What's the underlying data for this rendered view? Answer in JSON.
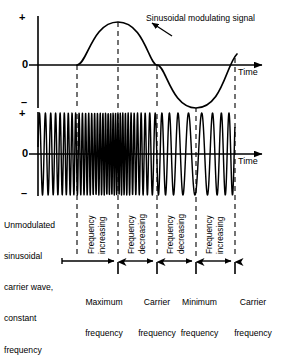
{
  "figure": {
    "kind": "frequency-modulation-waveform-diagram",
    "background_color": "#ffffff",
    "ink_color": "#000000"
  },
  "top_plot": {
    "axis_plus": "+",
    "axis_zero": "0",
    "axis_minus": "–",
    "time_label": "Time",
    "annotation": "Sinusoidal modulating signal"
  },
  "bottom_plot": {
    "axis_plus": "+",
    "axis_zero": "0",
    "axis_minus": "–",
    "time_label": "Time"
  },
  "left_caption": {
    "lines": [
      "Unmodulated",
      "sinusoidal",
      "carrier wave,",
      "constant",
      "frequency"
    ]
  },
  "region_labels": [
    {
      "line1": "Frequency",
      "line2": "increasing"
    },
    {
      "line1": "Frequency",
      "line2": "decreasing"
    },
    {
      "line1": "Frequency",
      "line2": "decreasing"
    },
    {
      "line1": "Frequency",
      "line2": "increasing"
    }
  ],
  "marker_labels": [
    {
      "line1": "Maximum",
      "line2": "frequency"
    },
    {
      "line1": "Carrier",
      "line2": "frequency"
    },
    {
      "line1": "Minimum",
      "line2": "frequency"
    },
    {
      "line1": "Carrier",
      "line2": "frequency"
    }
  ],
  "chart_data": {
    "type": "line",
    "xlabel": "Time",
    "ylabel": "",
    "grid": false,
    "legend_position": "none",
    "guide_lines_x": [
      77,
      118,
      157,
      196,
      235
    ],
    "series": [
      {
        "name": "Sinusoidal modulating signal",
        "plot": "top",
        "description": "One full cycle of a sine wave: zero crossing rising at x=77, positive peak at x=118, zero crossing falling at x=157, negative trough at x=196, zero crossing rising at x=235",
        "x_axis_range": [
          38,
          235
        ],
        "y_axis_labels": [
          "+",
          "0",
          "–"
        ],
        "key_points": [
          {
            "x": 77,
            "y": 0,
            "note": "zero crossing rising"
          },
          {
            "x": 118,
            "y": 1,
            "note": "positive peak"
          },
          {
            "x": 157,
            "y": 0,
            "note": "zero crossing falling"
          },
          {
            "x": 196,
            "y": -1,
            "note": "negative trough"
          },
          {
            "x": 235,
            "y": 0,
            "note": "zero crossing rising"
          }
        ]
      },
      {
        "name": "Frequency modulated carrier wave",
        "plot": "bottom",
        "description": "Constant-amplitude carrier whose instantaneous frequency follows the modulating sine: highest density at x=118, lowest density at x=196",
        "x_axis_range": [
          38,
          235
        ],
        "y_axis_labels": [
          "+",
          "0",
          "–"
        ],
        "amplitude_constant": true,
        "instantaneous_frequency_points": [
          {
            "x": 38,
            "relative_frequency": 1.0,
            "note": "carrier frequency"
          },
          {
            "x": 77,
            "relative_frequency": 1.9,
            "note": "frequency increasing"
          },
          {
            "x": 118,
            "relative_frequency": 2.8,
            "note": "maximum frequency"
          },
          {
            "x": 157,
            "relative_frequency": 1.0,
            "note": "carrier frequency"
          },
          {
            "x": 196,
            "relative_frequency": 0.45,
            "note": "minimum frequency"
          },
          {
            "x": 235,
            "relative_frequency": 1.0,
            "note": "carrier frequency"
          }
        ]
      }
    ],
    "regions": [
      {
        "from_x": 77,
        "to_x": 118,
        "label": "Frequency increasing"
      },
      {
        "from_x": 118,
        "to_x": 157,
        "label": "Frequency decreasing"
      },
      {
        "from_x": 157,
        "to_x": 196,
        "label": "Frequency decreasing"
      },
      {
        "from_x": 196,
        "to_x": 235,
        "label": "Frequency increasing"
      }
    ],
    "markers": [
      {
        "x": 118,
        "label": "Maximum frequency"
      },
      {
        "x": 157,
        "label": "Carrier frequency"
      },
      {
        "x": 196,
        "label": "Minimum frequency"
      },
      {
        "x": 235,
        "label": "Carrier frequency"
      }
    ]
  }
}
